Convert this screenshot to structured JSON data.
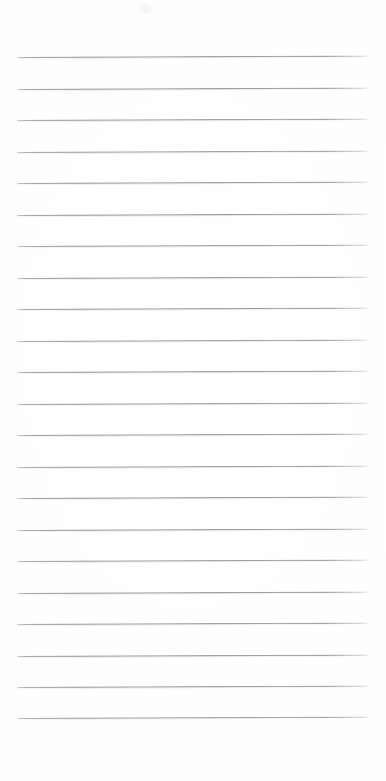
{
  "document": {
    "type": "ruled-paper-scan",
    "title": "Blank ruled notepad page",
    "content_text": "",
    "background_color": "#fefefe",
    "page_width_px": 386,
    "page_height_px": 781
  },
  "ruling": {
    "line_color": "#8c8c92",
    "line_count": 22,
    "line_thickness_px": 1,
    "line_start_x_px": 17,
    "line_end_x_px": 369,
    "first_line_y_px": 57,
    "line_spacing_px": 31.5,
    "skew_degrees": -0.22,
    "lines": [
      {
        "index": 1,
        "y": 57.0,
        "x_start": 17,
        "x_end": 369,
        "opacity": 0.93
      },
      {
        "index": 2,
        "y": 88.5,
        "x_start": 17,
        "x_end": 369,
        "opacity": 0.95
      },
      {
        "index": 3,
        "y": 120.0,
        "x_start": 17,
        "x_end": 369,
        "opacity": 0.92
      },
      {
        "index": 4,
        "y": 151.5,
        "x_start": 17,
        "x_end": 369,
        "opacity": 0.9
      },
      {
        "index": 5,
        "y": 183.0,
        "x_start": 17,
        "x_end": 369,
        "opacity": 0.94
      },
      {
        "index": 6,
        "y": 214.5,
        "x_start": 17,
        "x_end": 369,
        "opacity": 0.96
      },
      {
        "index": 7,
        "y": 246.0,
        "x_start": 17,
        "x_end": 369,
        "opacity": 0.91
      },
      {
        "index": 8,
        "y": 277.5,
        "x_start": 17,
        "x_end": 369,
        "opacity": 0.94
      },
      {
        "index": 9,
        "y": 309.0,
        "x_start": 17,
        "x_end": 369,
        "opacity": 0.93
      },
      {
        "index": 10,
        "y": 340.5,
        "x_start": 17,
        "x_end": 369,
        "opacity": 0.9
      },
      {
        "index": 11,
        "y": 372.0,
        "x_start": 17,
        "x_end": 369,
        "opacity": 0.95
      },
      {
        "index": 12,
        "y": 403.5,
        "x_start": 17,
        "x_end": 369,
        "opacity": 0.92
      },
      {
        "index": 13,
        "y": 435.0,
        "x_start": 17,
        "x_end": 369,
        "opacity": 0.94
      },
      {
        "index": 14,
        "y": 466.5,
        "x_start": 17,
        "x_end": 369,
        "opacity": 0.91
      },
      {
        "index": 15,
        "y": 498.0,
        "x_start": 17,
        "x_end": 369,
        "opacity": 0.96
      },
      {
        "index": 16,
        "y": 529.5,
        "x_start": 17,
        "x_end": 369,
        "opacity": 0.93
      },
      {
        "index": 17,
        "y": 561.0,
        "x_start": 17,
        "x_end": 369,
        "opacity": 0.9
      },
      {
        "index": 18,
        "y": 592.5,
        "x_start": 17,
        "x_end": 369,
        "opacity": 0.95
      },
      {
        "index": 19,
        "y": 624.0,
        "x_start": 17,
        "x_end": 369,
        "opacity": 0.92
      },
      {
        "index": 20,
        "y": 655.5,
        "x_start": 17,
        "x_end": 369,
        "opacity": 0.94
      },
      {
        "index": 21,
        "y": 687.0,
        "x_start": 17,
        "x_end": 369,
        "opacity": 0.91
      },
      {
        "index": 22,
        "y": 717.5,
        "x_start": 17,
        "x_end": 369,
        "opacity": 0.88
      }
    ]
  },
  "margins": {
    "top_blank_px": 57,
    "bottom_blank_px": 63,
    "left_px": 17,
    "right_px": 17
  },
  "artifacts": [
    {
      "name": "scan-speck",
      "x": 138,
      "y": 4,
      "width": 16,
      "height": 10,
      "opacity": 0.09
    }
  ]
}
